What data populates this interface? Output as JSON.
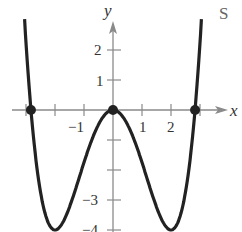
{
  "corner_text": "S",
  "chart_data": {
    "type": "line",
    "title": "",
    "xlabel": "x",
    "ylabel": "y",
    "function": "y = x^4/4 - 2x^2",
    "xlim": [
      -3.4,
      3.6
    ],
    "ylim": [
      -4,
      3
    ],
    "x_ticks": [
      -3,
      -2,
      -1,
      1,
      2,
      3
    ],
    "x_tick_labels": [
      "-1",
      "1",
      "2"
    ],
    "y_ticks": [
      -4,
      -3,
      -2,
      -1,
      1,
      2
    ],
    "y_tick_labels": [
      "2",
      "1",
      "-3",
      "-4"
    ],
    "grid": false,
    "legend": null,
    "series": [
      {
        "name": "curve",
        "x": [
          -3.0,
          -2.83,
          -2.5,
          -2.0,
          -1.5,
          -1.0,
          -0.5,
          0,
          0.5,
          1.0,
          1.5,
          2.0,
          2.5,
          2.83,
          3.0
        ],
        "y": [
          2.25,
          0,
          -2.73,
          -4,
          -3.23,
          -1.75,
          -0.48,
          0,
          -0.48,
          -1.75,
          -3.23,
          -4,
          -2.73,
          0,
          2.25
        ]
      }
    ],
    "points": [
      {
        "x": -2.83,
        "y": 0
      },
      {
        "x": 0,
        "y": 0
      },
      {
        "x": 2.83,
        "y": 0
      }
    ],
    "axis_labels": {
      "x": "x",
      "y": "y"
    }
  }
}
